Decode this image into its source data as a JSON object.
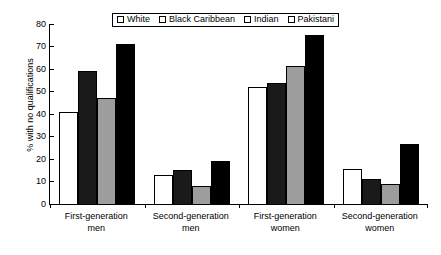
{
  "chart_data": {
    "type": "bar",
    "title": "",
    "xlabel": "",
    "ylabel": "% with no qualifications",
    "ylim": [
      0,
      80
    ],
    "yticks": [
      0,
      10,
      20,
      30,
      40,
      50,
      60,
      70,
      80
    ],
    "grid": false,
    "legend_position": "top-center",
    "categories": [
      "First-generation men",
      "Second-generation men",
      "First-generation women",
      "Second-generation women"
    ],
    "category_lines": [
      [
        "First-generation",
        "men"
      ],
      [
        "Second-generation",
        "men"
      ],
      [
        "First-generation",
        "women"
      ],
      [
        "Second-generation",
        "women"
      ]
    ],
    "series": [
      {
        "name": "White",
        "color": "#ffffff",
        "values": [
          41,
          13,
          52,
          15.5
        ]
      },
      {
        "name": "Black Caribbean",
        "color": "#1a1a1a",
        "values": [
          59,
          15,
          54,
          11
        ]
      },
      {
        "name": "Indian",
        "color": "#9d9d9d",
        "values": [
          47,
          8,
          61.5,
          9
        ]
      },
      {
        "name": "Pakistani",
        "color": "#000000",
        "values": [
          71,
          19,
          75,
          26.5
        ]
      }
    ]
  }
}
